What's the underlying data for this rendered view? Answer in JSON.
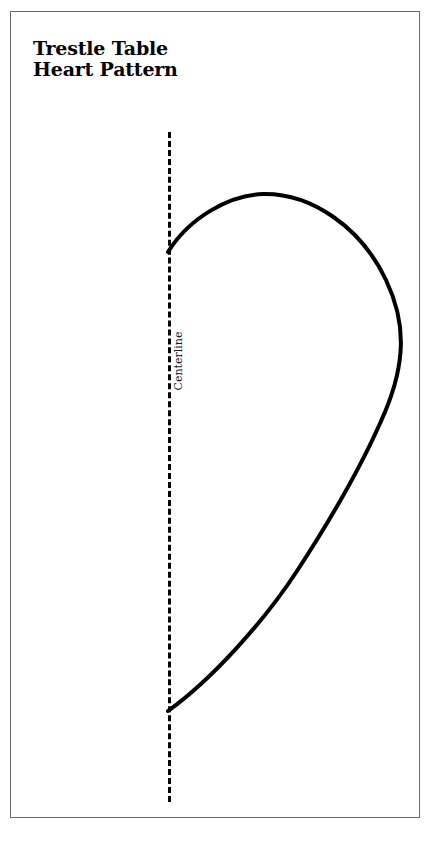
{
  "page": {
    "background_color": "#ffffff",
    "width": 446,
    "height": 851
  },
  "frame": {
    "border_color": "#6a6a6a",
    "fill_color": "#ffffff"
  },
  "title": {
    "line1": "Trestle Table",
    "line2": "Heart Pattern",
    "color": "#000000"
  },
  "centerline": {
    "label": "Centerline",
    "orientation": "vertical",
    "style": "dashed",
    "color": "#000000",
    "x": 158,
    "y_start": 120,
    "y_end": 790
  },
  "pattern": {
    "name": "half-heart-outline",
    "stroke_color": "#000000",
    "stroke_width": 4,
    "fill": "none",
    "top_anchor": [
      157,
      240
    ],
    "apex": [
      262,
      182
    ],
    "rightmost": [
      392,
      330
    ],
    "bottom_anchor": [
      157,
      699
    ],
    "path": "M 157 240 C 178 206 218 183 252 182 C 300 181 350 215 375 268 C 396 312 394 352 374 400 C 352 452 318 510 286 559 C 252 611 200 668 157 699"
  }
}
